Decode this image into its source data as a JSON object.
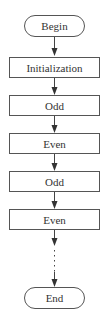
{
  "diagram": {
    "type": "flowchart",
    "nodes": [
      {
        "id": "begin",
        "label": "Begin",
        "shape": "terminal"
      },
      {
        "id": "init",
        "label": "Initialization",
        "shape": "process"
      },
      {
        "id": "odd1",
        "label": "Odd",
        "shape": "process"
      },
      {
        "id": "even1",
        "label": "Even",
        "shape": "process"
      },
      {
        "id": "odd2",
        "label": "Odd",
        "shape": "process"
      },
      {
        "id": "even2",
        "label": "Even",
        "shape": "process"
      },
      {
        "id": "end",
        "label": "End",
        "shape": "terminal"
      }
    ],
    "edges": [
      {
        "from": "begin",
        "to": "init",
        "style": "solid"
      },
      {
        "from": "init",
        "to": "odd1",
        "style": "solid"
      },
      {
        "from": "odd1",
        "to": "even1",
        "style": "solid"
      },
      {
        "from": "even1",
        "to": "odd2",
        "style": "solid"
      },
      {
        "from": "odd2",
        "to": "even2",
        "style": "solid"
      },
      {
        "from": "even2",
        "to": "end",
        "style": "dotted"
      }
    ],
    "colors": {
      "stroke": "#555555",
      "text": "#333333",
      "background": "#ffffff"
    }
  }
}
